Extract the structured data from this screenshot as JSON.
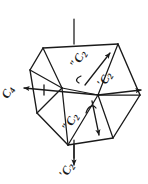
{
  "figure": {
    "background_color": "#ffffff",
    "line_color": "#1a1a1a",
    "width": 148,
    "height": 184
  },
  "labels": {
    "c4": {
      "symbol": "C",
      "subscript": "4",
      "prime": "",
      "full": "C4",
      "rotation_deg": -62
    },
    "c2_prime_right": {
      "symbol": "C",
      "subscript": "2",
      "prime": "′",
      "full": "C2′",
      "rotation_deg": -60
    },
    "c2_prime_bottom": {
      "symbol": "C",
      "subscript": "2",
      "prime": "′",
      "full": "C2′",
      "rotation_deg": -62
    },
    "c2_dprime_top": {
      "symbol": "C",
      "subscript": "2",
      "prime": "″",
      "full": "C2″",
      "rotation_deg": -62
    },
    "c2_dprime_bottom": {
      "symbol": "C",
      "subscript": "2",
      "prime": "″",
      "full": "C2″",
      "rotation_deg": -62
    }
  },
  "axes": [
    {
      "name": "C4",
      "orientation": "vertical",
      "style": "line-through-body",
      "arrow": "none"
    },
    {
      "name": "C2-prime-left",
      "orientation": "horizontal-left",
      "style": "arrow",
      "arrow": "left"
    },
    {
      "name": "C2-prime-right",
      "orientation": "horizontal-right",
      "style": "arrow",
      "arrow": "right"
    },
    {
      "name": "C2-prime-bottom",
      "orientation": "vertical-down",
      "style": "arrow",
      "arrow": "down"
    },
    {
      "name": "C2-dprime-top",
      "orientation": "diagonal-up-right",
      "style": "arrow",
      "arrow": "up-right"
    },
    {
      "name": "C2-dprime-bottom",
      "orientation": "diagonal-down-right",
      "style": "arrow",
      "arrow": "down-right"
    }
  ]
}
